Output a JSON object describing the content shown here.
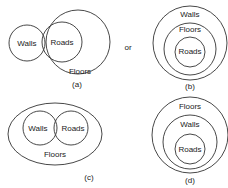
{
  "diagrams": {
    "a": {
      "caption": "(a)",
      "labels": {
        "walls": "Walls",
        "roads": "Roads",
        "floors": "Floors"
      }
    },
    "connector": "or",
    "b": {
      "caption": "(b)",
      "labels": {
        "walls": "Walls",
        "floors": "Floors",
        "roads": "Roads"
      }
    },
    "c": {
      "caption": "(c)",
      "labels": {
        "walls": "Walls",
        "roads": "Roads",
        "floors": "Floors"
      }
    },
    "d": {
      "caption": "(d)",
      "labels": {
        "floors": "Floors",
        "walls": "Walls",
        "roads": "Roads"
      }
    }
  },
  "colors": {
    "stroke": "#333333",
    "text": "#222222",
    "background": "#ffffff"
  }
}
